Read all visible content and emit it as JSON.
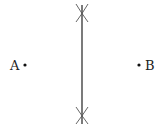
{
  "diagram": {
    "type": "perpendicular-bisector-construction",
    "points": [
      {
        "label": "A",
        "x": 25,
        "y": 65
      },
      {
        "label": "B",
        "x": 139,
        "y": 65
      }
    ],
    "bisector": {
      "x": 82,
      "y1": 5,
      "y2": 124
    },
    "arc_intersections": [
      {
        "x": 82,
        "y": 15
      },
      {
        "x": 82,
        "y": 115
      }
    ],
    "colors": {
      "line": "#333333",
      "arc": "#555555",
      "point": "#111111",
      "text": "#222222"
    }
  }
}
